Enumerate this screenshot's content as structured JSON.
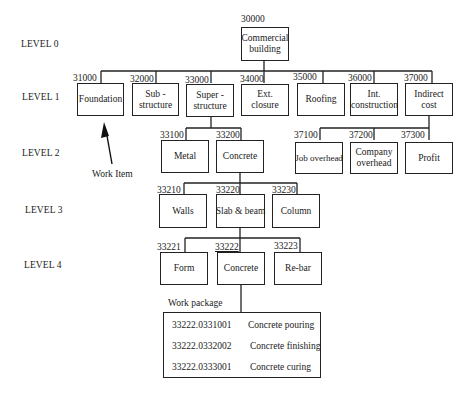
{
  "levels": [
    "LEVEL 0",
    "LEVEL 1",
    "LEVEL 2",
    "LEVEL 3",
    "LEVEL 4"
  ],
  "root": {
    "code": "30000",
    "label": "Commercial building"
  },
  "level1": [
    {
      "code": "31000",
      "label": "Foundation"
    },
    {
      "code": "32000",
      "label": "Sub - structure"
    },
    {
      "code": "33000",
      "label": "Super - structure"
    },
    {
      "code": "34000",
      "label": "Ext. closure"
    },
    {
      "code": "35000",
      "label": "Roofing"
    },
    {
      "code": "36000",
      "label": "Int. construction"
    },
    {
      "code": "37000",
      "label": "Indirect cost"
    }
  ],
  "level2_super": [
    {
      "code": "33100",
      "label": "Metal"
    },
    {
      "code": "33200",
      "label": "Concrete"
    }
  ],
  "level2_indirect": [
    {
      "code": "37100",
      "label": "Job overhead"
    },
    {
      "code": "37200",
      "label": "Company overhead"
    },
    {
      "code": "37300",
      "label": "Profit"
    }
  ],
  "level3": [
    {
      "code": "33210",
      "label": "Walls"
    },
    {
      "code": "33220",
      "label": "Slab & beam"
    },
    {
      "code": "33230",
      "label": "Column"
    }
  ],
  "level4": [
    {
      "code": "33221",
      "label": "Form"
    },
    {
      "code": "33222",
      "label": "Concrete"
    },
    {
      "code": "33223",
      "label": "Re-bar"
    }
  ],
  "annotations": {
    "work_item": "Work Item",
    "work_package": "Work package"
  },
  "work_package": [
    {
      "id": "33222.0331001",
      "task": "Concrete pouring"
    },
    {
      "id": "33222.0332002",
      "task": "Concrete finishing"
    },
    {
      "id": "33222.0333001",
      "task": "Concrete curing"
    }
  ]
}
